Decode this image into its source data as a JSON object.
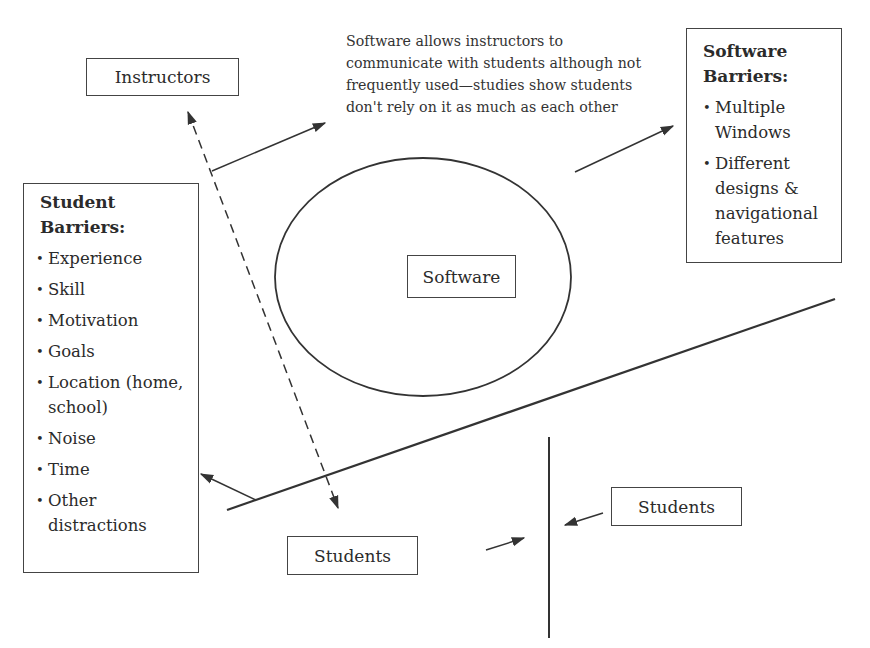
{
  "diagram": {
    "nodes": {
      "instructors": {
        "label": "Instructors"
      },
      "software": {
        "label": "Software"
      },
      "students_bottom": {
        "label": "Students"
      },
      "students_right": {
        "label": "Students"
      }
    },
    "annotation": {
      "text": "Software allows instructors to communicate with students although not frequently used—studies show students don't rely on it as much as each other"
    },
    "student_barriers": {
      "title_line1": "Student",
      "title_line2": "Barriers:",
      "items": [
        "Experience",
        "Skill",
        "Motivation",
        "Goals",
        "Location (home, school)",
        "Noise",
        "Time",
        "Other distractions"
      ]
    },
    "software_barriers": {
      "title_line1": "Software",
      "title_line2": "Barriers:",
      "items": [
        "Multiple Windows",
        "Different designs & navigational features"
      ]
    },
    "colors": {
      "stroke": "#333333",
      "text": "#2b2b2b",
      "background": "#ffffff"
    }
  }
}
